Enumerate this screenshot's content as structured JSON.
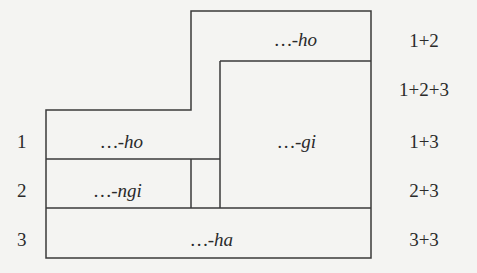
{
  "diagram": {
    "row_numbers": [
      "1",
      "2",
      "3"
    ],
    "cells": {
      "top_right": "…-ho",
      "row1_left": "…-ho",
      "right_inner": "…-gi",
      "row2_left": "…-ngi",
      "row3": "…-ha"
    },
    "right_labels": [
      "1+2",
      "1+2+3",
      "1+3",
      "2+3",
      "3+3"
    ],
    "line_color": "#3a3a3a",
    "background": "#f4f4f2"
  }
}
